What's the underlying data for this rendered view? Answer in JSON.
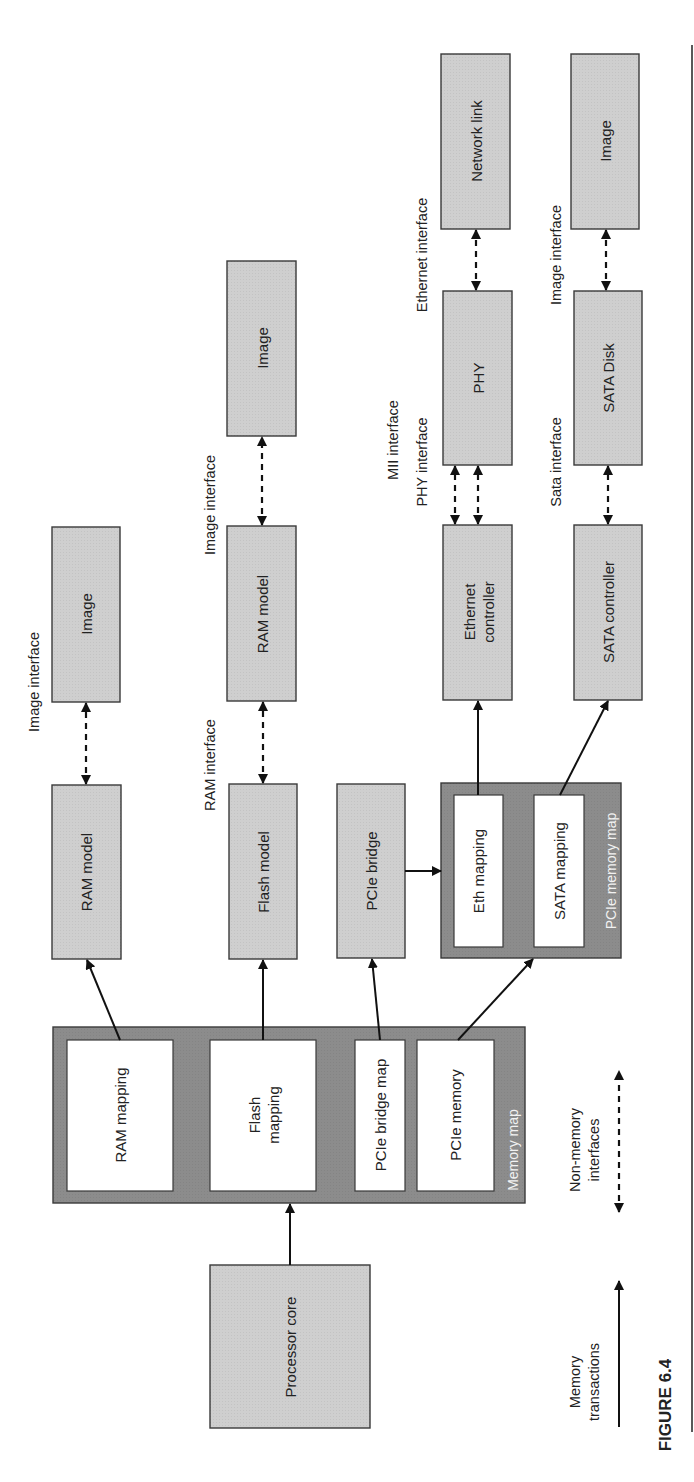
{
  "figure": {
    "label": "FIGURE 6.4",
    "orientation": "rotated 90° counter-clockwise"
  },
  "colors": {
    "component_fill": "#cfcfcf",
    "memory_map_fill": "#8c8c8c",
    "mapping_fill": "#ffffff",
    "line": "#111111"
  },
  "blocks": {
    "processor_core": "Processor core",
    "memory_map": {
      "title": "Memory map",
      "entries": {
        "ram_mapping": "RAM mapping",
        "flash_mapping_line1": "Flash",
        "flash_mapping_line2": "mapping",
        "pcie_bridge_map": "PCIe bridge map",
        "pcie_memory": "PCIe memory"
      }
    },
    "ram_model_1": "RAM model",
    "image_1": "Image",
    "flash_model": "Flash model",
    "ram_model_2": "RAM model",
    "image_2": "Image",
    "pcie_bridge": "PCIe bridge",
    "pcie_memory_map": {
      "title": "PCIe memory map",
      "entries": {
        "eth_mapping": "Eth mapping",
        "sata_mapping": "SATA mapping"
      }
    },
    "ethernet_controller_line1": "Ethernet",
    "ethernet_controller_line2": "controller",
    "phy": "PHY",
    "network_link": "Network link",
    "sata_controller": "SATA controller",
    "sata_disk": "SATA Disk",
    "image_3": "Image"
  },
  "interfaces": {
    "image_interface_1": "Image interface",
    "ram_interface": "RAM interface",
    "image_interface_2": "Image interface",
    "mii_interface": "MII interface",
    "phy_interface": "PHY interface",
    "ethernet_interface": "Ethernet interface",
    "sata_interface": "Sata interface",
    "image_interface_3": "Image interface"
  },
  "legend": {
    "memory_transactions_line1": "Memory",
    "memory_transactions_line2": "transactions",
    "non_memory_line1": "Non-memory",
    "non_memory_line2": "interfaces"
  },
  "connections": [
    {
      "from": "Processor core",
      "to": "Memory map",
      "type": "memory transaction"
    },
    {
      "from": "RAM mapping",
      "to": "RAM model",
      "type": "memory transaction"
    },
    {
      "from": "Flash mapping",
      "to": "Flash model",
      "type": "memory transaction"
    },
    {
      "from": "PCIe bridge map",
      "to": "PCIe bridge",
      "type": "memory transaction"
    },
    {
      "from": "PCIe memory",
      "to": "PCIe memory map",
      "type": "memory transaction"
    },
    {
      "from": "PCIe bridge",
      "to": "PCIe memory map",
      "type": "memory transaction"
    },
    {
      "from": "Eth mapping",
      "to": "Ethernet controller",
      "type": "memory transaction"
    },
    {
      "from": "SATA mapping",
      "to": "SATA controller",
      "type": "memory transaction"
    },
    {
      "from": "RAM model",
      "to": "Image",
      "type": "non-memory interface",
      "label": "Image interface"
    },
    {
      "from": "Flash model",
      "to": "RAM model",
      "type": "non-memory interface",
      "label": "RAM interface"
    },
    {
      "from": "RAM model",
      "to": "Image",
      "type": "non-memory interface",
      "label": "Image interface"
    },
    {
      "from": "Ethernet controller",
      "to": "PHY",
      "type": "non-memory interface",
      "label": "MII interface"
    },
    {
      "from": "Ethernet controller",
      "to": "PHY",
      "type": "non-memory interface",
      "label": "PHY interface"
    },
    {
      "from": "PHY",
      "to": "Network link",
      "type": "non-memory interface",
      "label": "Ethernet interface"
    },
    {
      "from": "SATA controller",
      "to": "SATA Disk",
      "type": "non-memory interface",
      "label": "Sata interface"
    },
    {
      "from": "SATA Disk",
      "to": "Image",
      "type": "non-memory interface",
      "label": "Image interface"
    }
  ]
}
